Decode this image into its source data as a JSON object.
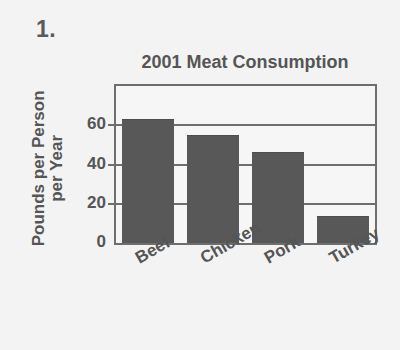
{
  "question_number": "1.",
  "chart_data": {
    "type": "bar",
    "title": "2001 Meat Consumption",
    "xlabel": "",
    "ylabel": "Pounds per Person per Year",
    "ylabel_line1": "Pounds per Person",
    "ylabel_line2": "per Year",
    "categories": [
      "Beef",
      "Chicken",
      "Pork",
      "Turkey"
    ],
    "values": [
      63,
      55,
      46.5,
      14
    ],
    "ylim": [
      0,
      80
    ],
    "yticks": [
      "0",
      "20",
      "40",
      "60"
    ],
    "ytick_values": [
      0,
      20,
      40,
      60
    ],
    "grid": true,
    "legend": "none",
    "bar_color": "#585858",
    "frame_color": "#6e6e6e",
    "text_color": "#555555",
    "background_color": "#f3f3f3",
    "category_label_rotation": -30
  }
}
